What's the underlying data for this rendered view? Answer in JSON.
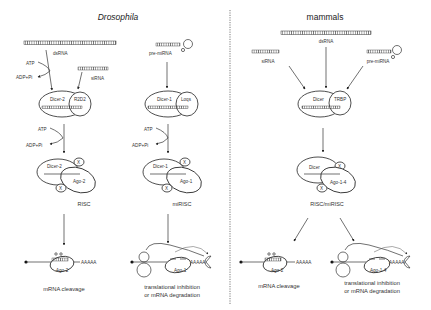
{
  "panels": {
    "left": {
      "title": "Drosophila",
      "sirna_pathway": {
        "input": "dsRNA",
        "co_input": "siRNA",
        "energy": {
          "consumed": "ATP",
          "released": "ADP+Pi"
        },
        "processing_complex": {
          "enzyme": "Dicer-2",
          "partner": "R2D2"
        },
        "effector": {
          "enzyme": "Dicer-2",
          "argonaute": "Ago-2",
          "unknown": "X",
          "name": "RISC"
        },
        "target_argonaute": "Ago-2",
        "polyA": "AAAAA",
        "outcome": "mRNA cleavage"
      },
      "mirna_pathway": {
        "input": "pre-miRNA",
        "energy": {
          "consumed": "ATP",
          "released": "ADP+Pi"
        },
        "processing_complex": {
          "enzyme": "Dicer-1",
          "partner": "Loqs"
        },
        "effector": {
          "enzyme": "Dicer-1",
          "argonaute": "Ago-1",
          "unknown": "X",
          "name": "miRISC"
        },
        "target_argonaute": "Ago-1",
        "polyA": "AAAAA",
        "outcome_line1": "translational inhibition",
        "outcome_line2": "or mRNA degradation"
      }
    },
    "right": {
      "title": "mammals",
      "inputs": [
        "siRNA",
        "dsRNA",
        "pre-miRNA"
      ],
      "processing_complex": {
        "enzyme": "Dicer",
        "partner": "TRBP"
      },
      "effector": {
        "enzyme": "Dicer",
        "argonaute": "Ago-1-4",
        "unknown": "X",
        "name": "RISC/miRISC"
      },
      "cleavage": {
        "argonaute": "Ago-2",
        "polyA": "AAAAA",
        "outcome": "mRNA cleavage"
      },
      "repression": {
        "argonaute": "Ago-1-4",
        "polyA": "AAAAA",
        "outcome_line1": "translational inhibition",
        "outcome_line2": "or mRNA degradation"
      }
    }
  }
}
